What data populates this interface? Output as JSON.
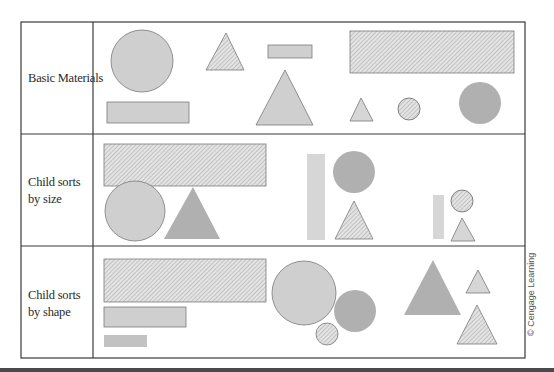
{
  "figure": {
    "rows": [
      {
        "label_line1": "Basic Materials",
        "label_line2": ""
      },
      {
        "label_line1": "Child sorts",
        "label_line2": "by size"
      },
      {
        "label_line1": "Child sorts",
        "label_line2": "by shape"
      }
    ],
    "credit": "© Cengage Learning"
  },
  "colors": {
    "border": "#3a3a3a",
    "light_fill": "#cfcfcf",
    "dark_fill": "#b0b0b0",
    "hatch_bg": "#e2e2e2",
    "hatch_line": "#9a9a9a",
    "shape_stroke": "#7a7a7a"
  }
}
